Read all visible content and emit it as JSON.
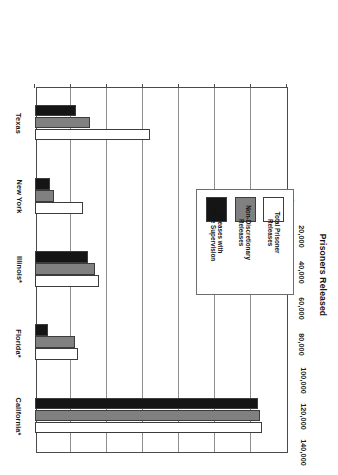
{
  "chart_data": {
    "type": "bar",
    "orientation": "horizontal",
    "title": "",
    "xlabel": "Prisoners Released",
    "ylabel": "",
    "categories": [
      "California*",
      "Florida*",
      "Illinois*",
      "New York",
      "Texas"
    ],
    "series": [
      {
        "name": "Total Prisoner Releases",
        "color": "#ffffff",
        "values": [
          126000,
          24000,
          35500,
          26500,
          64000
        ]
      },
      {
        "name": "Non-Discretionary Releases",
        "color": "#808080",
        "values": [
          125000,
          22500,
          33500,
          10500,
          30500
        ]
      },
      {
        "name": "Releases with Parole Supervision",
        "color": "#151515",
        "values": [
          124000,
          7500,
          29500,
          8500,
          23000
        ]
      }
    ],
    "xlim": [
      0,
      140000
    ],
    "xticks": [
      0,
      20000,
      40000,
      60000,
      80000,
      100000,
      120000,
      140000
    ],
    "xtick_labels": [
      "0",
      "20,000",
      "40,000",
      "60,000",
      "80,000",
      "100,000",
      "120,000",
      "140,000"
    ],
    "grid": true,
    "legend_position": "middle-left-inside"
  },
  "axis": {
    "title": "Prisoners Released",
    "ticks": [
      {
        "value": 0,
        "label": "0"
      },
      {
        "value": 20000,
        "label": "20,000"
      },
      {
        "value": 40000,
        "label": "40,000"
      },
      {
        "value": 60000,
        "label": "60,000"
      },
      {
        "value": 80000,
        "label": "80,000"
      },
      {
        "value": 100000,
        "label": "100,000"
      },
      {
        "value": 120000,
        "label": "120,000"
      },
      {
        "value": 140000,
        "label": "140,000"
      }
    ]
  },
  "categories": [
    {
      "label": "California*"
    },
    {
      "label": "Florida*"
    },
    {
      "label": "Illinois*"
    },
    {
      "label": "New York"
    },
    {
      "label": "Texas"
    }
  ],
  "legend": {
    "entries": [
      {
        "label": "Total Prisoner\nReleases",
        "color": "#ffffff",
        "swatch_class": "sw-total"
      },
      {
        "label": "Non-Discretionary\nReleases",
        "color": "#808080",
        "swatch_class": "sw-nondisc"
      },
      {
        "label": "Releases with\nParole Supervision",
        "color": "#151515",
        "swatch_class": "sw-parole"
      }
    ]
  }
}
